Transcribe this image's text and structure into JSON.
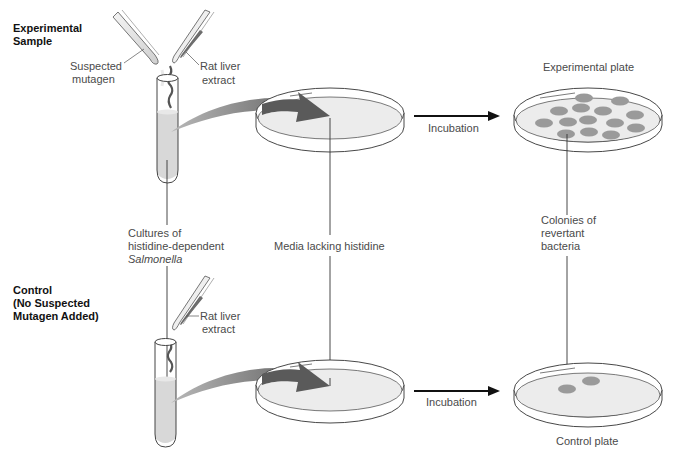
{
  "sections": {
    "experimental": {
      "heading_line1": "Experimental",
      "heading_line2": "Sample",
      "suspected_mutagen_line1": "Suspected",
      "suspected_mutagen_line2": "mutagen",
      "rat_liver_line1": "Rat liver",
      "rat_liver_line2": "extract",
      "incubation": "Incubation",
      "plate_label": "Experimental plate",
      "colony_count": 15
    },
    "control": {
      "heading_line1": "Control",
      "heading_line2": "(No Suspected",
      "heading_line3": "Mutagen Added)",
      "rat_liver_line1": "Rat liver",
      "rat_liver_line2": "extract",
      "incubation": "Incubation",
      "plate_label": "Control plate",
      "colony_count": 2
    }
  },
  "shared_labels": {
    "cultures_line1": "Cultures of",
    "cultures_line2": "histidine-dependent",
    "cultures_line3": "Salmonella",
    "media": "Media lacking histidine",
    "colonies_line1": "Colonies of",
    "colonies_line2": "revertant",
    "colonies_line3": "bacteria"
  },
  "colors": {
    "line": "#333333",
    "liquid": "#d8d8d8",
    "media": "#ebebeb",
    "colony": "#9a9a9a",
    "arrow": "#6e6e6e",
    "reagent": "#555555"
  }
}
